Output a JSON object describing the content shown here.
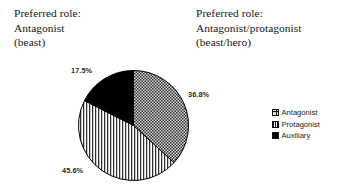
{
  "headings": {
    "left": {
      "line1": "Preferred role:",
      "line2": "Antagonist",
      "line3": "(beast)"
    },
    "right": {
      "line1": "Preferred role:",
      "line2": "Antagonist/protagonist",
      "line3": "(beast/hero)"
    }
  },
  "legend": {
    "items": [
      {
        "label": "Antagonist",
        "swatch": "crosshatch-swatch-icon",
        "color": "#d9d9d9"
      },
      {
        "label": "Protagonist",
        "swatch": "vertical-stripe-swatch-icon",
        "color": "#ffffff"
      },
      {
        "label": "Auxiliary",
        "swatch": "solid-black-swatch-icon",
        "color": "#000000"
      }
    ]
  },
  "labels": {
    "antagonist_pct": "36.8%",
    "protagonist_pct": "45.6%",
    "auxiliary_pct": "17.5%"
  },
  "chart_data": {
    "type": "pie",
    "title": "",
    "subtitle": "",
    "categories": [
      "Antagonist",
      "Protagonist",
      "Auxiliary"
    ],
    "values": [
      36.8,
      45.6,
      17.5
    ],
    "unit": "%",
    "data_labels": [
      "36.8%",
      "45.6%",
      "17.5%"
    ],
    "start_angle_deg": 0,
    "direction": "clockwise",
    "legend_position": "right",
    "grid": false,
    "fills": [
      "crosshatch",
      "vertical-stripes",
      "solid-black"
    ],
    "outline_color": "#000000"
  }
}
